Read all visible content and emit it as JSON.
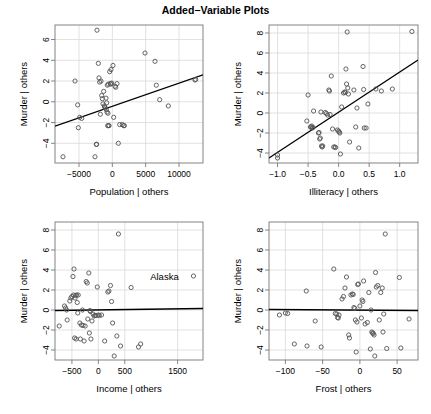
{
  "figure": {
    "title": "Added−Variable Plots",
    "background_color": "#ffffff",
    "foreground_color": "#000000",
    "grid_color": "#d9d9d9",
    "point_color": "#555555",
    "line_color": "#000000",
    "width": 431,
    "height": 414,
    "panel_rows": 2,
    "panel_cols": 2
  },
  "chart_data": [
    {
      "type": "scatter",
      "title": "Added−Variable Plots",
      "panel": "top-left",
      "xlabel": "Population | others",
      "ylabel": "Murder | others",
      "xlim": [
        -8600,
        13600
      ],
      "ylim": [
        -5.9,
        7.4
      ],
      "xticks": [
        -5000,
        0,
        5000,
        10000
      ],
      "xticklabels": [
        "-5000",
        "0",
        "5000",
        "10000"
      ],
      "yticks": [
        -4,
        -2,
        0,
        2,
        4,
        6
      ],
      "yticklabels": [
        "-4",
        "-2",
        "0",
        "2",
        "4",
        "6"
      ],
      "grid": true,
      "legend": null,
      "annotations": [],
      "fit_line": {
        "type": "least-squares",
        "x0": -8600,
        "y0": -2.35,
        "x1": 13600,
        "y1": 2.6
      },
      "points": [
        [
          -7400,
          -5.3
        ],
        [
          -5600,
          2.0
        ],
        [
          -5200,
          -0.3
        ],
        [
          -5100,
          -2.5
        ],
        [
          -4900,
          -1.5
        ],
        [
          -4600,
          -1.6
        ],
        [
          -2600,
          -5.3
        ],
        [
          -2400,
          -4.1
        ],
        [
          -2350,
          -4.1
        ],
        [
          -2300,
          6.9
        ],
        [
          -2100,
          3.7
        ],
        [
          -2000,
          2.3
        ],
        [
          -1900,
          1.9
        ],
        [
          -1800,
          -1.2
        ],
        [
          -1700,
          2.0
        ],
        [
          -1600,
          0.6
        ],
        [
          -1500,
          0.3
        ],
        [
          -1400,
          -0.2
        ],
        [
          -1300,
          1.0
        ],
        [
          -1200,
          -0.4
        ],
        [
          -1150,
          -0.5
        ],
        [
          -1050,
          -0.6
        ],
        [
          -950,
          0.35
        ],
        [
          -900,
          -0.75
        ],
        [
          -850,
          -0.1
        ],
        [
          -800,
          -1.0
        ],
        [
          -750,
          1.6
        ],
        [
          -700,
          -2.3
        ],
        [
          -650,
          -1.1
        ],
        [
          -600,
          1.7
        ],
        [
          -550,
          -2.3
        ],
        [
          -500,
          -2.3
        ],
        [
          -400,
          2.9
        ],
        [
          -300,
          1.75
        ],
        [
          -250,
          1.7
        ],
        [
          -200,
          3.1
        ],
        [
          -100,
          1.8
        ],
        [
          100,
          3.5
        ],
        [
          200,
          -1.5
        ],
        [
          400,
          1.5
        ],
        [
          500,
          1.4
        ],
        [
          700,
          1.75
        ],
        [
          900,
          -4.0
        ],
        [
          1100,
          -2.2
        ],
        [
          1500,
          -2.2
        ],
        [
          1700,
          -2.3
        ],
        [
          1800,
          -2.3
        ],
        [
          4900,
          4.7
        ],
        [
          6400,
          3.9
        ],
        [
          6600,
          1.6
        ],
        [
          7100,
          0.2
        ],
        [
          8400,
          -0.4
        ],
        [
          12400,
          2.1
        ],
        [
          12500,
          2.15
        ]
      ]
    },
    {
      "type": "scatter",
      "panel": "top-right",
      "xlabel": "Illiteracy | others",
      "ylabel": "Murder | others",
      "xlim": [
        -1.14,
        1.3
      ],
      "ylim": [
        -5.0,
        8.8
      ],
      "xticks": [
        -1.0,
        -0.5,
        0.0,
        0.5,
        1.0
      ],
      "xticklabels": [
        "-1.0",
        "-0.5",
        "0.0",
        "0.5",
        "1.0"
      ],
      "yticks": [
        -4,
        -2,
        0,
        2,
        4,
        6,
        8
      ],
      "yticklabels": [
        "-4",
        "-2",
        "0",
        "2",
        "4",
        "6",
        "8"
      ],
      "grid": true,
      "legend": null,
      "annotations": [],
      "fit_line": {
        "type": "least-squares",
        "x0": -1.14,
        "y0": -4.5,
        "x1": 1.3,
        "y1": 5.3
      },
      "points": [
        [
          -1.0,
          -4.2
        ],
        [
          -1.0,
          -4.5
        ],
        [
          -0.52,
          -0.8
        ],
        [
          -0.5,
          1.8
        ],
        [
          -0.46,
          -1.4
        ],
        [
          -0.45,
          -1.4
        ],
        [
          -0.44,
          -1.3
        ],
        [
          -0.43,
          -1.5
        ],
        [
          -0.42,
          -1.45
        ],
        [
          -0.41,
          0.2
        ],
        [
          -0.33,
          -2.0
        ],
        [
          -0.32,
          -1.95
        ],
        [
          -0.31,
          -2.6
        ],
        [
          -0.3,
          -2.5
        ],
        [
          -0.29,
          0.1
        ],
        [
          -0.28,
          -3.3
        ],
        [
          -0.27,
          -3.4
        ],
        [
          -0.26,
          -3.3
        ],
        [
          -0.22,
          0.05
        ],
        [
          -0.2,
          -0.05
        ],
        [
          -0.18,
          -0.2
        ],
        [
          -0.16,
          2.3
        ],
        [
          -0.15,
          2.2
        ],
        [
          -0.14,
          -0.15
        ],
        [
          -0.12,
          3.7
        ],
        [
          -0.1,
          -1.6
        ],
        [
          -0.08,
          -3.4
        ],
        [
          -0.06,
          -3.4
        ],
        [
          -0.05,
          -3.45
        ],
        [
          -0.02,
          -1.7
        ],
        [
          0.0,
          -1.8
        ],
        [
          0.01,
          -1.9
        ],
        [
          0.02,
          -2.0
        ],
        [
          0.03,
          -4.1
        ],
        [
          0.05,
          0.6
        ],
        [
          0.08,
          2.0
        ],
        [
          0.1,
          2.1
        ],
        [
          0.11,
          2.05
        ],
        [
          0.12,
          4.4
        ],
        [
          0.13,
          2.9
        ],
        [
          0.14,
          8.1
        ],
        [
          0.15,
          2.5
        ],
        [
          0.16,
          1.9
        ],
        [
          0.18,
          -2.9
        ],
        [
          0.25,
          2.3
        ],
        [
          0.28,
          -1.4
        ],
        [
          0.3,
          0.5
        ],
        [
          0.33,
          -3.5
        ],
        [
          0.4,
          4.65
        ],
        [
          0.41,
          2.35
        ],
        [
          0.42,
          -1.5
        ],
        [
          0.45,
          -1.5
        ],
        [
          0.48,
          0.9
        ],
        [
          0.61,
          2.4
        ],
        [
          0.7,
          2.2
        ],
        [
          0.88,
          2.4
        ],
        [
          1.2,
          8.15
        ]
      ]
    },
    {
      "type": "scatter",
      "panel": "bottom-left",
      "xlabel": "Income | others",
      "ylabel": "Murder | others",
      "xlim": [
        -820,
        1980
      ],
      "ylim": [
        -5.0,
        8.8
      ],
      "xticks": [
        -500,
        0,
        500,
        1500
      ],
      "xticklabels": [
        "-500",
        "0",
        "500",
        "1500"
      ],
      "yticks": [
        -4,
        -2,
        0,
        2,
        4,
        6,
        8
      ],
      "yticklabels": [
        "-4",
        "-2",
        "0",
        "2",
        "4",
        "6",
        "8"
      ],
      "grid": true,
      "legend": null,
      "annotations": [
        {
          "text": "Alaska",
          "x": 1520,
          "y": 3.4,
          "point_x": 1800,
          "point_y": 3.4
        }
      ],
      "fit_line": {
        "type": "least-squares",
        "x0": -820,
        "y0": -0.05,
        "x1": 1980,
        "y1": 0.15
      },
      "points": [
        [
          -740,
          -1.6
        ],
        [
          -640,
          0.4
        ],
        [
          -620,
          0.2
        ],
        [
          -600,
          0.0
        ],
        [
          -590,
          -1.0
        ],
        [
          -540,
          0.9
        ],
        [
          -520,
          1.2
        ],
        [
          -500,
          1.35
        ],
        [
          -480,
          3.35
        ],
        [
          -470,
          1.5
        ],
        [
          -460,
          4.1
        ],
        [
          -450,
          -2.8
        ],
        [
          -440,
          1.2
        ],
        [
          -430,
          1.45
        ],
        [
          -420,
          -2.9
        ],
        [
          -410,
          1.5
        ],
        [
          -400,
          0.75
        ],
        [
          -390,
          -0.3
        ],
        [
          -380,
          1.5
        ],
        [
          -350,
          -1.3
        ],
        [
          -340,
          -2.9
        ],
        [
          -320,
          -1.5
        ],
        [
          -300,
          0.0
        ],
        [
          -290,
          -1.55
        ],
        [
          -270,
          -3.1
        ],
        [
          -250,
          -1.6
        ],
        [
          -230,
          2.85
        ],
        [
          -210,
          2.7
        ],
        [
          -200,
          -0.9
        ],
        [
          -180,
          3.7
        ],
        [
          -170,
          -2.3
        ],
        [
          -160,
          -0.05
        ],
        [
          -150,
          -0.15
        ],
        [
          -140,
          -2.9
        ],
        [
          -120,
          -1.1
        ],
        [
          -100,
          -0.4
        ],
        [
          -80,
          -0.6
        ],
        [
          -60,
          -0.55
        ],
        [
          -40,
          -0.55
        ],
        [
          -20,
          2.3
        ],
        [
          0,
          -0.5
        ],
        [
          20,
          -0.55
        ],
        [
          60,
          -0.5
        ],
        [
          120,
          -3.1
        ],
        [
          180,
          1.8
        ],
        [
          200,
          1.9
        ],
        [
          230,
          2.45
        ],
        [
          250,
          0.85
        ],
        [
          270,
          -1.3
        ],
        [
          300,
          -4.6
        ],
        [
          350,
          -2.6
        ],
        [
          380,
          7.6
        ],
        [
          420,
          -3.6
        ],
        [
          620,
          2.25
        ],
        [
          760,
          -3.7
        ],
        [
          800,
          -3.4
        ],
        [
          1800,
          3.4
        ]
      ]
    },
    {
      "type": "scatter",
      "panel": "bottom-right",
      "xlabel": "Frost | others",
      "ylabel": "Murder | others",
      "xlim": [
        -122,
        78
      ],
      "ylim": [
        -5.0,
        8.8
      ],
      "xticks": [
        -100,
        -50,
        0,
        50
      ],
      "xticklabels": [
        "-100",
        "-50",
        "0",
        "50"
      ],
      "yticks": [
        -4,
        -2,
        0,
        2,
        4,
        6,
        8
      ],
      "yticklabels": [
        "-4",
        "-2",
        "0",
        "2",
        "4",
        "6",
        "8"
      ],
      "grid": true,
      "legend": null,
      "annotations": [],
      "fit_line": {
        "type": "least-squares",
        "x0": -122,
        "y0": 0.05,
        "x1": 78,
        "y1": -0.05
      },
      "points": [
        [
          -108,
          -0.5
        ],
        [
          -100,
          -0.3
        ],
        [
          -97,
          -0.35
        ],
        [
          -88,
          -3.4
        ],
        [
          -72,
          1.9
        ],
        [
          -71,
          -3.6
        ],
        [
          -60,
          -1.1
        ],
        [
          -52,
          -3.7
        ],
        [
          -35,
          4.1
        ],
        [
          -33,
          -0.35
        ],
        [
          -31,
          -0.4
        ],
        [
          -30,
          -0.75
        ],
        [
          -29,
          -0.8
        ],
        [
          -28,
          -0.5
        ],
        [
          -24,
          1.1
        ],
        [
          -22,
          1.35
        ],
        [
          -20,
          2.2
        ],
        [
          -18,
          3.3
        ],
        [
          -15,
          -2.5
        ],
        [
          -14,
          -2.8
        ],
        [
          -12,
          1.5
        ],
        [
          -10,
          1.6
        ],
        [
          -9,
          1.55
        ],
        [
          -8,
          0.25
        ],
        [
          -7,
          0.15
        ],
        [
          -6,
          -1.0
        ],
        [
          -5,
          -4.2
        ],
        [
          -4,
          -1.2
        ],
        [
          -3,
          2.55
        ],
        [
          -2,
          2.6
        ],
        [
          0,
          0.4
        ],
        [
          2,
          -0.8
        ],
        [
          3,
          1.0
        ],
        [
          4,
          0.85
        ],
        [
          5,
          2.9
        ],
        [
          7,
          -1.4
        ],
        [
          10,
          -1.25
        ],
        [
          12,
          1.75
        ],
        [
          14,
          -3.9
        ],
        [
          15,
          0.0
        ],
        [
          16,
          -2.2
        ],
        [
          17,
          -2.3
        ],
        [
          18,
          -2.35
        ],
        [
          19,
          -2.5
        ],
        [
          20,
          -4.6
        ],
        [
          21,
          3.75
        ],
        [
          22,
          2.3
        ],
        [
          24,
          2.45
        ],
        [
          26,
          -1.0
        ],
        [
          28,
          1.75
        ],
        [
          30,
          2.2
        ],
        [
          31,
          -2.2
        ],
        [
          32,
          -0.4
        ],
        [
          34,
          7.6
        ],
        [
          36,
          -3.85
        ],
        [
          53,
          3.25
        ],
        [
          55,
          -3.8
        ],
        [
          66,
          -0.9
        ]
      ]
    }
  ]
}
